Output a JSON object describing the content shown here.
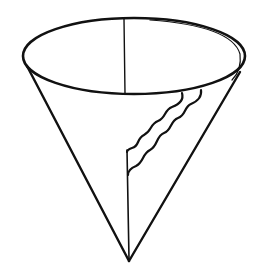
{
  "figure": {
    "subject": "paper cone cup line drawing",
    "colors": {
      "background": "#ffffff",
      "ink": "#111111"
    },
    "parts": {
      "rim": "elliptical cup rim",
      "left_side": "left cone edge",
      "right_side": "right cone edge",
      "center_line": "vertical line across rim",
      "seam": "vertical seam to apex",
      "wavy_edges": [
        "upper wavy overlap edge",
        "lower wavy overlap edge"
      ]
    }
  }
}
